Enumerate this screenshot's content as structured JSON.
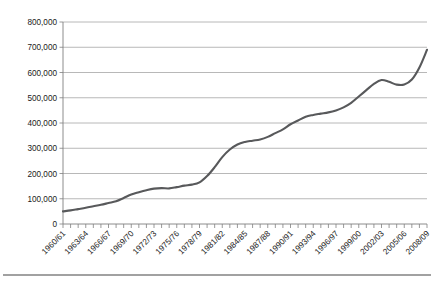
{
  "chart_data": {
    "type": "line",
    "title": "",
    "subtitle": "",
    "xlabel": "",
    "ylabel": "",
    "ylim": [
      0,
      800000
    ],
    "ytick_labels": [
      "800,000",
      "700,000",
      "600,000",
      "500,000",
      "400,000",
      "300,000",
      "200,000",
      "100,000",
      "0"
    ],
    "ytick_values": [
      800000,
      700000,
      600000,
      500000,
      400000,
      300000,
      200000,
      100000,
      0
    ],
    "grid": "horizontal",
    "legend": "none",
    "xtick_label_interval": 3,
    "xtick_labels": [
      "1960/61",
      "1963/64",
      "1966/67",
      "1969/70",
      "1972/73",
      "1975/76",
      "1978/79",
      "1981/82",
      "1984/85",
      "1987/88",
      "1990/91",
      "1993/94",
      "1996/97",
      "1999/00",
      "2002/03",
      "2005/06",
      "2008/09"
    ],
    "line_color": "#58595b",
    "categories": [
      "1960/61",
      "1961/62",
      "1962/63",
      "1963/64",
      "1964/65",
      "1965/66",
      "1966/67",
      "1967/68",
      "1968/69",
      "1969/70",
      "1970/71",
      "1971/72",
      "1972/73",
      "1973/74",
      "1974/75",
      "1975/76",
      "1976/77",
      "1977/78",
      "1978/79",
      "1979/80",
      "1980/81",
      "1981/82",
      "1982/83",
      "1983/84",
      "1984/85",
      "1985/86",
      "1986/87",
      "1987/88",
      "1988/89",
      "1989/90",
      "1990/91",
      "1991/92",
      "1992/93",
      "1993/94",
      "1994/95",
      "1995/96",
      "1996/97",
      "1997/98",
      "1998/99",
      "1999/00",
      "2000/01",
      "2001/02",
      "2002/03",
      "2003/04",
      "2004/05",
      "2005/06",
      "2006/07",
      "2007/08",
      "2008/09"
    ],
    "values": [
      50000,
      54000,
      59000,
      64000,
      70000,
      76000,
      83000,
      90000,
      103000,
      117000,
      126000,
      134000,
      140000,
      142000,
      141000,
      146000,
      152000,
      156000,
      165000,
      190000,
      225000,
      265000,
      295000,
      315000,
      325000,
      330000,
      335000,
      345000,
      360000,
      375000,
      395000,
      410000,
      425000,
      432000,
      437000,
      442000,
      450000,
      462000,
      480000,
      505000,
      530000,
      555000,
      570000,
      563000,
      552000,
      552000,
      572000,
      620000,
      690000
    ]
  }
}
